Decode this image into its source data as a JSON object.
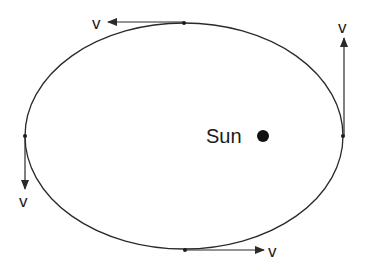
{
  "diagram": {
    "colors": {
      "line": "#2a2a2a",
      "text": "#1a1a1a",
      "background": "#ffffff"
    },
    "orbit": {
      "cx": 184,
      "cy": 136,
      "rx": 159,
      "ry": 113
    },
    "sun": {
      "label": "Sun",
      "x": 263,
      "y": 136,
      "r": 6
    },
    "points": [
      {
        "name": "top",
        "x": 184,
        "y": 23,
        "velocity_label": "v",
        "direction": "left"
      },
      {
        "name": "right",
        "x": 343,
        "y": 136,
        "velocity_label": "v",
        "direction": "up"
      },
      {
        "name": "bottom",
        "x": 185,
        "y": 250,
        "velocity_label": "v",
        "direction": "right"
      },
      {
        "name": "left",
        "x": 25,
        "y": 136,
        "velocity_label": "v",
        "direction": "down"
      }
    ]
  }
}
